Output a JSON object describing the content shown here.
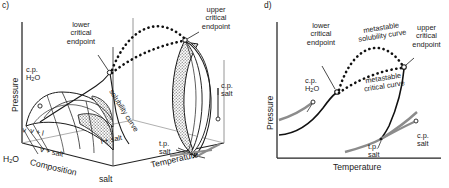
{
  "figure": {
    "type": "phase-diagram-pair"
  },
  "panel_c": {
    "id": "c)",
    "axes": {
      "pressure": "Pressure",
      "composition": "Composition",
      "temperature": "Temperature"
    },
    "corner_labels": {
      "water": "H₂O",
      "salt_front": "salt",
      "salt_right": "salt"
    },
    "annotations": {
      "lower_critical_endpoint": "lower\ncritical\nendpoint",
      "upper_critical_endpoint": "upper\ncritical\nendpoint",
      "cp_water": "c.p.\nH₂O",
      "cp_salt": "c.p.\nsalt",
      "tp_salt": "t.p.\nsalt",
      "solubility_curve": "solubility curve"
    },
    "field_labels": {
      "vapour": "v",
      "vapour_liquid": "v + l",
      "vapour_salt": "v + salt",
      "liquid_salt": "l + salt"
    }
  },
  "panel_d": {
    "id": "d)",
    "axes": {
      "pressure": "Pressure",
      "temperature": "Temperature"
    },
    "annotations": {
      "lower_critical_endpoint": "lower\ncritical\nendpoint",
      "upper_critical_endpoint": "upper\ncritical\nendpoint",
      "cp_water": "c.p.\nH₂O",
      "cp_salt": "c.p.\nsalt",
      "tp_salt": "t.p.\nsalt",
      "metastable_solubility_curve": "metastable\nsolubility curve",
      "metastable_critical_curve": "metastable\ncritical curve"
    }
  },
  "colors": {
    "line": "#1a1a1a",
    "gray_curve": "#8c8c8c",
    "axis_thin": "#555555",
    "shade_fill": "#b5b5b5",
    "background": "#ffffff",
    "surface_white": "#ffffff"
  }
}
